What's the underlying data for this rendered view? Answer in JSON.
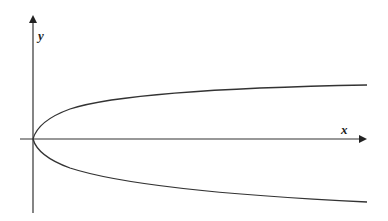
{
  "figure": {
    "x_axis_label": "x",
    "y_axis_label": "y",
    "curve": "x = k·y² (rightward-opening), vertex at origin",
    "colors": {
      "stroke": "#333333",
      "background": "#ffffff"
    }
  }
}
